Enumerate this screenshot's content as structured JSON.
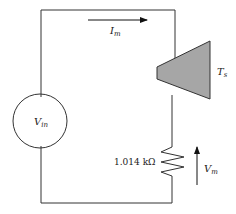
{
  "diagram": {
    "type": "circuit",
    "colors": {
      "wire": "#333333",
      "transistor_fill": "#a6a6a6",
      "background": "#ffffff"
    },
    "source": {
      "label_main": "V",
      "label_sub": "in"
    },
    "current": {
      "label_main": "I",
      "label_sub": "m",
      "direction": "right"
    },
    "sensor": {
      "label_main": "T",
      "label_sub": "s"
    },
    "resistor": {
      "value": "1.014 kΩ"
    },
    "measured_voltage": {
      "label_main": "V",
      "label_sub": "m",
      "direction": "up"
    }
  }
}
